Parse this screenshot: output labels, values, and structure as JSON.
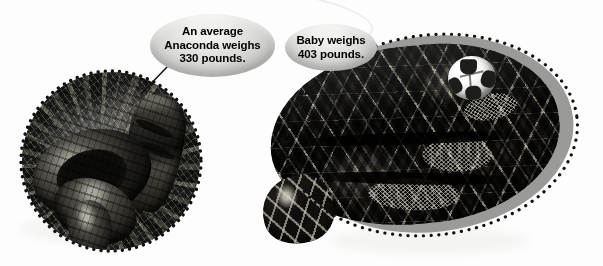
{
  "figure": {
    "kind": "annotated-photo-comparison",
    "background_color": "#ffffff"
  },
  "callouts": [
    {
      "id": "anaconda-weight",
      "lines": [
        "An average",
        "Anaconda weighs",
        "330 pounds."
      ],
      "full_text": "An average Anaconda weighs 330 pounds.",
      "shape": "ellipse",
      "fill": "#d8d8d6",
      "text_color": "#000000",
      "points_to": "left-circle-photo"
    },
    {
      "id": "baby-weight",
      "lines": [
        "Baby weighs",
        "403 pounds."
      ],
      "full_text": "Baby weighs 403 pounds.",
      "shape": "ellipse",
      "fill": "#d8d8d6",
      "text_color": "#000000",
      "points_to": "right-snake-photo"
    }
  ],
  "photos": [
    {
      "id": "left-circle-photo",
      "name": "anaconda-in-leaf-litter",
      "shape": "circle",
      "border": "dotted",
      "border_color": "#111111",
      "tone": "black-and-white",
      "description": "Coiled dark anaconda resting on forest leaf litter"
    },
    {
      "id": "right-snake-photo",
      "name": "coiled-python-with-soccer-ball",
      "shape": "irregular-oval",
      "backdrop": "grey-oval",
      "backdrop_color": "#9a9a99",
      "border": "dotted",
      "border_color": "#111111",
      "tone": "black-and-white",
      "description": "Large coiled reticulated python with a soccer ball resting on its body for scale"
    }
  ],
  "props": [
    {
      "id": "soccer-ball",
      "name": "soccer-ball",
      "colors": [
        "#ffffff",
        "#1d1d1b"
      ],
      "purpose": "size reference"
    }
  ],
  "weights": {
    "average_anaconda_pounds": 330,
    "baby_pounds": 403,
    "unit": "pounds"
  }
}
